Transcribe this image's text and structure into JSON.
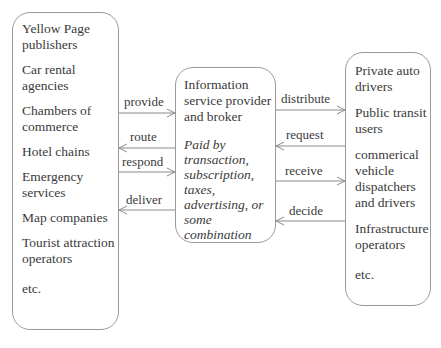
{
  "left_box": {
    "items": [
      "Yellow Page publishers",
      "Car rental agencies",
      "Chambers of commerce",
      "Hotel chains",
      "Emergency services",
      "Map companies",
      "Tourist attraction operators",
      "etc."
    ]
  },
  "center_box": {
    "title": "Information service provider and broker",
    "note": "Paid by transaction, subscription, taxes, advertising, or some combination"
  },
  "right_box": {
    "items": [
      "Private auto drivers",
      "Public transit users",
      "commerical vehicle dispatchers and drivers",
      "Infrastructure operators",
      "etc."
    ]
  },
  "left_arrows": [
    {
      "label": "provide",
      "direction": "right"
    },
    {
      "label": "route",
      "direction": "left"
    },
    {
      "label": "respond",
      "direction": "right"
    },
    {
      "label": "deliver",
      "direction": "left"
    }
  ],
  "right_arrows": [
    {
      "label": "distribute",
      "direction": "right"
    },
    {
      "label": "request",
      "direction": "left"
    },
    {
      "label": "receive",
      "direction": "right"
    },
    {
      "label": "decide",
      "direction": "left"
    }
  ]
}
